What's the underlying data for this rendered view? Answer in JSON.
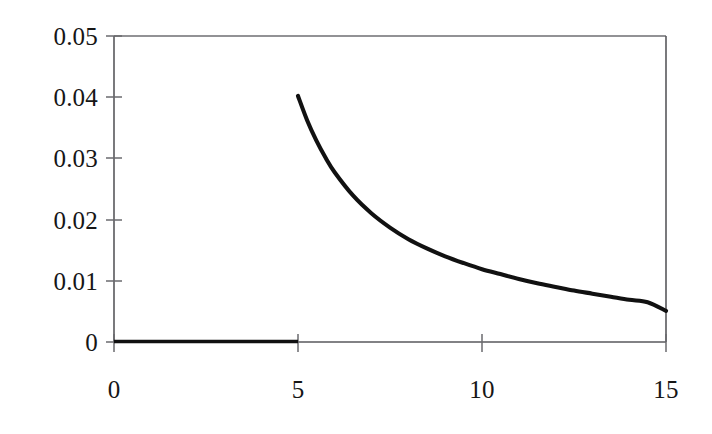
{
  "chart_data": {
    "type": "line",
    "title": "",
    "subtitle": "",
    "xlabel": "",
    "ylabel": "",
    "xlim": [
      0,
      15
    ],
    "ylim": [
      0,
      0.05
    ],
    "grid": false,
    "legend": null,
    "x_ticks": [
      "0",
      "5",
      "10",
      "15"
    ],
    "x_tick_values": [
      0,
      5,
      10,
      15
    ],
    "y_ticks": [
      "0",
      "0.01",
      "0.02",
      "0.03",
      "0.04",
      "0.05"
    ],
    "y_tick_values": [
      0,
      0.01,
      0.02,
      0.03,
      0.04,
      0.05
    ],
    "series": [
      {
        "name": "baseline-segment",
        "x": [
          0,
          1,
          2,
          3,
          4,
          5
        ],
        "values": [
          0,
          0,
          0,
          0,
          0,
          0
        ]
      },
      {
        "name": "decay-curve",
        "x": [
          5,
          5.25,
          5.5,
          5.75,
          6,
          6.5,
          7,
          7.5,
          8,
          8.5,
          9,
          9.5,
          10,
          10.5,
          11,
          11.5,
          12,
          12.5,
          13,
          13.5,
          14,
          14.5,
          15
        ],
        "values": [
          0.0402,
          0.0362,
          0.0329,
          0.0301,
          0.0277,
          0.0239,
          0.021,
          0.0187,
          0.0168,
          0.0153,
          0.014,
          0.0129,
          0.0119,
          0.0111,
          0.0103,
          0.0096,
          0.009,
          0.0084,
          0.0079,
          0.0074,
          0.0069,
          0.0065,
          0.0051
        ]
      }
    ],
    "axis_color": "#58585c",
    "curve_color": "#111111",
    "background_color": "#ffffff"
  },
  "geometry": {
    "plot_left": 114,
    "plot_right": 666,
    "plot_top": 36,
    "plot_bottom": 342
  }
}
